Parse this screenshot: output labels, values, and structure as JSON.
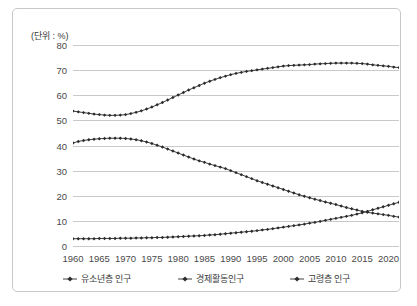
{
  "unit_label": "(단위 : %)",
  "chart_data": {
    "type": "line",
    "title": "",
    "subtitle": "",
    "xlabel": "",
    "ylabel": "(단위 : %)",
    "ylim": [
      0,
      80
    ],
    "yticks": [
      0,
      10,
      20,
      30,
      40,
      50,
      60,
      70,
      80
    ],
    "xlim": [
      1960,
      2022
    ],
    "xticks": [
      1960,
      1965,
      1970,
      1975,
      1980,
      1985,
      1990,
      1995,
      2000,
      2005,
      2010,
      2015,
      2020
    ],
    "grid": true,
    "legend_position": "bottom",
    "marker": "diamond",
    "line_color": "#2b2b2b",
    "grid_color": "#c9c9c9",
    "x": [
      1960,
      1961,
      1962,
      1963,
      1964,
      1965,
      1966,
      1967,
      1968,
      1969,
      1970,
      1971,
      1972,
      1973,
      1974,
      1975,
      1976,
      1977,
      1978,
      1979,
      1980,
      1981,
      1982,
      1983,
      1984,
      1985,
      1986,
      1987,
      1988,
      1989,
      1990,
      1991,
      1992,
      1993,
      1994,
      1995,
      1996,
      1997,
      1998,
      1999,
      2000,
      2001,
      2002,
      2003,
      2004,
      2005,
      2006,
      2007,
      2008,
      2009,
      2010,
      2011,
      2012,
      2013,
      2014,
      2015,
      2016,
      2017,
      2018,
      2019,
      2020,
      2021,
      2022
    ],
    "series": [
      {
        "name": "유소년층 인구",
        "values": [
          41.0,
          41.6,
          42.0,
          42.3,
          42.5,
          42.7,
          42.8,
          42.9,
          42.9,
          42.9,
          42.8,
          42.6,
          42.3,
          41.9,
          41.4,
          40.8,
          40.1,
          39.4,
          38.6,
          37.8,
          37.0,
          36.2,
          35.4,
          34.6,
          33.9,
          33.3,
          32.6,
          32.0,
          31.4,
          30.8,
          30.0,
          29.2,
          28.4,
          27.6,
          26.8,
          26.0,
          25.3,
          24.6,
          23.9,
          23.2,
          22.5,
          21.8,
          21.1,
          20.4,
          19.8,
          19.2,
          18.6,
          18.1,
          17.5,
          17.0,
          16.5,
          15.9,
          15.3,
          14.8,
          14.3,
          13.8,
          13.4,
          13.1,
          12.8,
          12.5,
          12.2,
          11.8,
          11.5
        ]
      },
      {
        "name": "경제활동인구",
        "values": [
          53.7,
          53.4,
          53.1,
          52.8,
          52.5,
          52.3,
          52.1,
          52.0,
          52.0,
          52.1,
          52.3,
          52.7,
          53.2,
          53.8,
          54.5,
          55.3,
          56.2,
          57.1,
          58.1,
          59.1,
          60.1,
          61.1,
          62.1,
          63.0,
          63.9,
          64.8,
          65.6,
          66.3,
          67.0,
          67.6,
          68.2,
          68.7,
          69.1,
          69.5,
          69.8,
          70.1,
          70.4,
          70.7,
          71.0,
          71.3,
          71.6,
          71.8,
          71.9,
          72.0,
          72.1,
          72.2,
          72.4,
          72.5,
          72.6,
          72.7,
          72.8,
          72.8,
          72.8,
          72.8,
          72.7,
          72.6,
          72.4,
          72.1,
          71.9,
          71.7,
          71.5,
          71.2,
          71.0
        ]
      },
      {
        "name": "고령층 인구",
        "values": [
          2.9,
          2.9,
          2.9,
          2.9,
          2.9,
          3.0,
          3.0,
          3.0,
          3.0,
          3.1,
          3.1,
          3.1,
          3.2,
          3.2,
          3.3,
          3.3,
          3.4,
          3.4,
          3.5,
          3.6,
          3.7,
          3.8,
          3.9,
          4.0,
          4.1,
          4.2,
          4.4,
          4.5,
          4.7,
          4.9,
          5.1,
          5.3,
          5.5,
          5.7,
          5.9,
          6.1,
          6.4,
          6.6,
          6.9,
          7.2,
          7.5,
          7.8,
          8.1,
          8.4,
          8.7,
          9.1,
          9.4,
          9.8,
          10.2,
          10.6,
          11.0,
          11.4,
          11.8,
          12.2,
          12.7,
          13.2,
          13.8,
          14.4,
          15.0,
          15.6,
          16.2,
          16.8,
          17.4
        ]
      }
    ]
  }
}
